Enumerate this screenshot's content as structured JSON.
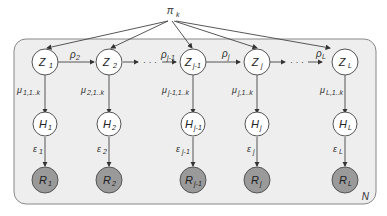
{
  "diagram": {
    "root": {
      "label": "π",
      "sub": "k"
    },
    "plate_label": "N",
    "colors": {
      "plate_fill": "#eeeeee",
      "plate_stroke": "#888888",
      "observed_fill": "#9a9a9a",
      "latent_fill": "#ffffff",
      "edge": "#444444"
    },
    "columns": [
      {
        "z": "Z",
        "z_sub": "1",
        "h": "H",
        "h_sub": "1",
        "r": "R",
        "r_sub": "1",
        "mu": "μ",
        "mu_sub": "1,1..k",
        "eps": "ε",
        "eps_sub": "1"
      },
      {
        "z": "Z",
        "z_sub": "2",
        "h": "H",
        "h_sub": "2",
        "r": "R",
        "r_sub": "2",
        "mu": "μ",
        "mu_sub": "2,1..k",
        "eps": "ε",
        "eps_sub": "2"
      },
      {
        "z": "Z",
        "z_sub": "j-1",
        "h": "H",
        "h_sub": "j-1",
        "r": "R",
        "r_sub": "j-1",
        "mu": "μ",
        "mu_sub": "j-1,1..k",
        "eps": "ε",
        "eps_sub": "j-1"
      },
      {
        "z": "Z",
        "z_sub": "j",
        "h": "H",
        "h_sub": "j",
        "r": "R",
        "r_sub": "j",
        "mu": "μ",
        "mu_sub": "j,1..k",
        "eps": "ε",
        "eps_sub": "j"
      },
      {
        "z": "Z",
        "z_sub": "L",
        "h": "H",
        "h_sub": "L",
        "r": "R",
        "r_sub": "L",
        "mu": "μ",
        "mu_sub": "L,1..k",
        "eps": "ε",
        "eps_sub": "L"
      }
    ],
    "transitions": [
      {
        "label": "ρ",
        "sub": "2"
      },
      {
        "label": "ρ",
        "sub": "j-1"
      },
      {
        "label": "ρ",
        "sub": "j"
      },
      {
        "label": "ρ",
        "sub": "L"
      }
    ],
    "ellipsis": "· · ·"
  }
}
